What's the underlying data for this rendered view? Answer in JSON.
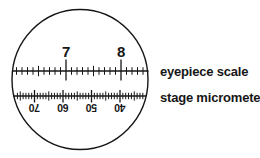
{
  "colors": {
    "ink": "#161616",
    "background": "#ffffff"
  },
  "field_of_view": {
    "shape": "circle"
  },
  "eyepiece_scale": {
    "label": "eyepiece scale",
    "numbered_ticks": [
      "7",
      "8"
    ],
    "minor_divisions_per_major": 10,
    "numbers_inverted": false
  },
  "stage_micrometer": {
    "label": "stage micrometer",
    "numbered_ticks": [
      "70",
      "60",
      "50",
      "40"
    ],
    "minor_divisions_per_major": 10,
    "numbers_inverted": true
  }
}
